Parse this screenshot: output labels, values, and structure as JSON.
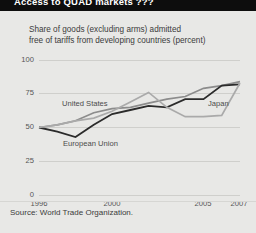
{
  "header": {
    "title": "Access to QUAD markets ???"
  },
  "figure": {
    "subtitle": "Share of goods (excluding arms) admitted\nfree of tariffs from developing countries (percent)",
    "source": "Source: World Trade Organization.",
    "colors": {
      "background": "#e8e8e6",
      "title_bar": "#0d0d0d",
      "grid": "#cfcfcc",
      "united_states": "#8c8c8c",
      "european_union": "#2b2b2b",
      "japan": "#aaaaaa"
    }
  },
  "chart_data": {
    "type": "line",
    "title": "Share of goods (excluding arms) admitted free of tariffs from developing countries (percent)",
    "xlabel": "",
    "ylabel": "percent",
    "xlim": [
      1996,
      2007
    ],
    "ylim": [
      0,
      100
    ],
    "yticks": [
      0,
      25,
      50,
      75,
      100
    ],
    "xticks": [
      1996,
      2000,
      2005,
      2007
    ],
    "xtick_labels": [
      "1996",
      "2000",
      "2005",
      "2007"
    ],
    "ytick_labels": [
      "0",
      "25",
      "50",
      "75",
      "100"
    ],
    "grid": true,
    "legend": "inline-labels",
    "x": [
      1996,
      1997,
      1998,
      1999,
      2000,
      2001,
      2002,
      2003,
      2004,
      2005,
      2006,
      2007
    ],
    "series": [
      {
        "name": "United States",
        "label_position": "inline-left",
        "values": [
          50,
          52,
          55,
          61,
          64,
          65,
          68,
          71,
          73,
          79,
          81,
          84
        ]
      },
      {
        "name": "European Union",
        "label_position": "inline-left-below",
        "values": [
          50,
          47,
          43,
          52,
          60,
          63,
          66,
          65,
          71,
          71,
          81,
          82
        ]
      },
      {
        "name": "Japan",
        "label_position": "inline-right",
        "values": [
          50,
          52,
          55,
          57,
          62,
          69,
          76,
          65,
          58,
          58,
          59,
          83
        ]
      }
    ]
  }
}
